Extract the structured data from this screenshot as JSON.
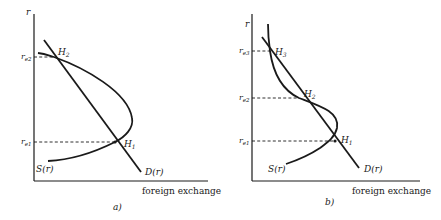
{
  "panels": [
    {
      "id": "a",
      "caption": "a)",
      "y_axis_label": "r",
      "x_axis_label": "foreign exchange",
      "supply_label": "S(r)",
      "demand_label": "D(r)",
      "rates": [
        {
          "label_main": "r",
          "label_sub": "e2"
        },
        {
          "label_main": "r",
          "label_sub": "e1"
        }
      ],
      "equilibria": [
        {
          "label_main": "H",
          "label_sub": "2"
        },
        {
          "label_main": "H",
          "label_sub": "1"
        }
      ]
    },
    {
      "id": "b",
      "caption": "b)",
      "y_axis_label": "r",
      "x_axis_label": "foreign exchange",
      "supply_label": "S(r)",
      "demand_label": "D(r)",
      "rates": [
        {
          "label_main": "r",
          "label_sub": "e3"
        },
        {
          "label_main": "r",
          "label_sub": "e2"
        },
        {
          "label_main": "r",
          "label_sub": "e1"
        }
      ],
      "equilibria": [
        {
          "label_main": "H",
          "label_sub": "3"
        },
        {
          "label_main": "H",
          "label_sub": "2"
        },
        {
          "label_main": "H",
          "label_sub": "1"
        }
      ]
    }
  ],
  "colors": {
    "ink": "#1a1a1a",
    "background": "#ffffff"
  }
}
